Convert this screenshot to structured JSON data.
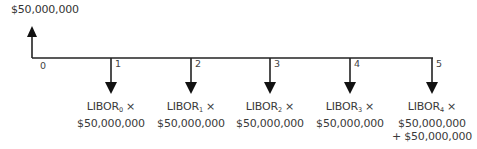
{
  "diagram": {
    "type": "cash-flow-timeline",
    "colors": {
      "line": "#222222",
      "text": "#3a3a3a"
    },
    "inflow": {
      "period": "0",
      "amount_label": "$50,000,000",
      "direction": "up"
    },
    "periods": [
      {
        "label": "0"
      },
      {
        "label": "1",
        "rate": "LIBOR",
        "subscript": "0",
        "times": " ×",
        "amount": "$50,000,000",
        "extra": ""
      },
      {
        "label": "2",
        "rate": "LIBOR",
        "subscript": "1",
        "times": " ×",
        "amount": "$50,000,000",
        "extra": ""
      },
      {
        "label": "3",
        "rate": "LIBOR",
        "subscript": "2",
        "times": " ×",
        "amount": "$50,000,000",
        "extra": ""
      },
      {
        "label": "4",
        "rate": "LIBOR",
        "subscript": "3",
        "times": " ×",
        "amount": "$50,000,000",
        "extra": ""
      },
      {
        "label": "5",
        "rate": "LIBOR",
        "subscript": "4",
        "times": " ×",
        "amount": "$50,000,000",
        "extra": "+ $50,000,000"
      }
    ]
  }
}
